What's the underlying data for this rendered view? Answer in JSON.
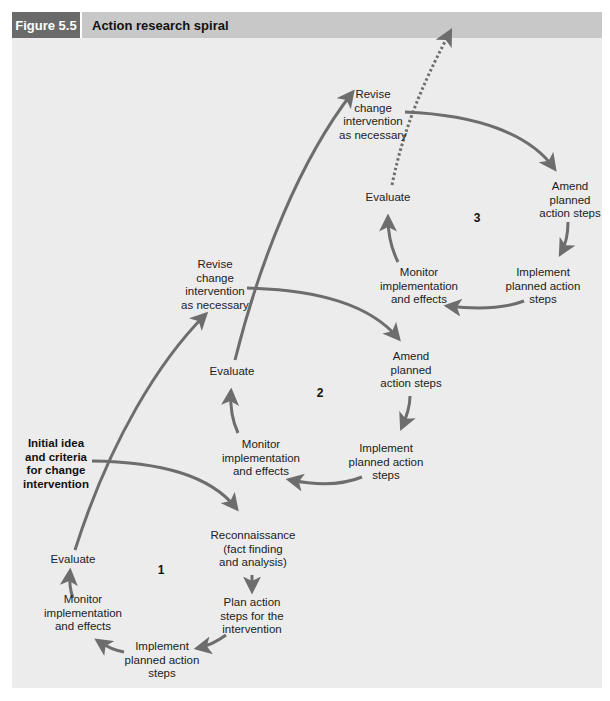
{
  "figure": {
    "number": "Figure 5.5",
    "title": "Action research spiral"
  },
  "colors": {
    "arrow": "#6d6d6d",
    "panel": "#ececec",
    "header_dark": "#6a6a6a",
    "header_light": "#c8c8c8"
  },
  "start": "Initial idea\nand criteria\nfor change\nintervention",
  "cycle1": {
    "number": "1",
    "reconnaissance": "Reconnaissance\n(fact finding\nand analysis)",
    "plan": "Plan action\nsteps for the\nintervention",
    "implement": "Implement\nplanned action\nsteps",
    "monitor": "Monitor\nimplementation\nand effects",
    "evaluate": "Evaluate"
  },
  "cycle2": {
    "number": "2",
    "revise": "Revise\nchange\nintervention\nas necessary",
    "amend": "Amend\nplanned\naction steps",
    "implement": "Implement\nplanned action\nsteps",
    "monitor": "Monitor\nimplementation\nand effects",
    "evaluate": "Evaluate"
  },
  "cycle3": {
    "number": "3",
    "revise": "Revise\nchange\nintervention\nas necessary",
    "amend": "Amend\nplanned\naction steps",
    "implement": "Implement\nplanned action\nsteps",
    "monitor": "Monitor\nimplementation\nand effects",
    "evaluate": "Evaluate"
  }
}
